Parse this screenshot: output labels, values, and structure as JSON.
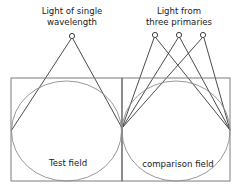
{
  "figure": {
    "width": 245,
    "height": 193,
    "background_color": "#ffffff"
  },
  "colors": {
    "box_stroke": "#7d7d7d",
    "circle_stroke": "#8c8c8c",
    "ray_stroke": "#2b2b2b",
    "text": "#1a1a1a",
    "source_fill": "#ffffff"
  },
  "labels": {
    "left_source_line1": "Light of single",
    "left_source_line2": "wavelength",
    "right_source_line1": "Light from",
    "right_source_line2": "three primaries",
    "test_field": "Test field",
    "comparison_field": "comparison field"
  },
  "geometry": {
    "left_box": {
      "x": 11,
      "y": 78,
      "width": 111,
      "height": 103
    },
    "right_box": {
      "x": 122,
      "y": 78,
      "width": 108,
      "height": 103
    },
    "divider_x": 122,
    "test_circle": {
      "cx": 66.5,
      "cy": 131,
      "rx": 55,
      "ry": 50
    },
    "comparison_circle": {
      "cx": 176,
      "cy": 131,
      "rx": 54,
      "ry": 50
    },
    "node_left": {
      "x": 11,
      "y": 131
    },
    "node_center": {
      "x": 122,
      "y": 128
    },
    "node_right": {
      "x": 230,
      "y": 130
    }
  },
  "sources": [
    {
      "name": "single-wavelength-source",
      "cx": 72,
      "cy": 36,
      "r": 2.6
    },
    {
      "name": "primary-source-1",
      "cx": 155,
      "cy": 35,
      "r": 2.6
    },
    {
      "name": "primary-source-2",
      "cx": 179,
      "cy": 35,
      "r": 2.6
    },
    {
      "name": "primary-source-3",
      "cx": 203,
      "cy": 35,
      "r": 2.6
    }
  ],
  "rays": [
    {
      "name": "ray-single-to-left-node",
      "x1": 71,
      "y1": 39,
      "x2": 11,
      "y2": 131
    },
    {
      "name": "ray-single-to-center-node",
      "x1": 73,
      "y1": 39,
      "x2": 122,
      "y2": 128
    },
    {
      "name": "ray-primary1-to-center-node",
      "x1": 154,
      "y1": 38,
      "x2": 122,
      "y2": 128
    },
    {
      "name": "ray-primary1-to-right-node",
      "x1": 156,
      "y1": 38,
      "x2": 230,
      "y2": 130
    },
    {
      "name": "ray-primary2-to-center-node",
      "x1": 178,
      "y1": 38,
      "x2": 122,
      "y2": 128
    },
    {
      "name": "ray-primary2-to-right-node",
      "x1": 180,
      "y1": 38,
      "x2": 230,
      "y2": 130
    },
    {
      "name": "ray-primary3-to-center-node",
      "x1": 202,
      "y1": 38,
      "x2": 122,
      "y2": 128
    },
    {
      "name": "ray-primary3-to-right-node",
      "x1": 204,
      "y1": 38,
      "x2": 230,
      "y2": 130
    }
  ],
  "text_positions": {
    "left_source_line1": {
      "x": 72,
      "y": 14
    },
    "left_source_line2": {
      "x": 72,
      "y": 25
    },
    "right_source_line1": {
      "x": 179,
      "y": 14
    },
    "right_source_line2": {
      "x": 179,
      "y": 25
    },
    "test_field": {
      "x": 68,
      "y": 166
    },
    "comparison_field": {
      "x": 178,
      "y": 167
    }
  }
}
